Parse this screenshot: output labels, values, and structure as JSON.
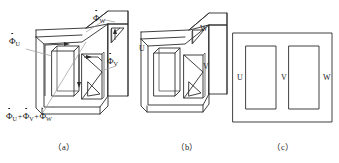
{
  "figure": {
    "type": "three-phase-transformer-core-diagram",
    "background_color": "#ffffff",
    "line_color": "#2b2b2b",
    "leader_color": "#9a9a9a"
  },
  "panels": [
    {
      "id": "a",
      "caption": "（a）",
      "description": "Three-dimensional three-phase transformer core with magnetic flux phasors",
      "flux_labels": [
        {
          "symbol": "Φ",
          "dot": true,
          "subscript": "U",
          "text": "Φ̇U"
        },
        {
          "symbol": "Φ",
          "dot": true,
          "subscript": "V",
          "text": "Φ̇V"
        },
        {
          "symbol": "Φ",
          "dot": true,
          "subscript": "W",
          "text": "Φ̇W"
        }
      ],
      "sum_label": {
        "parts": [
          {
            "symbol": "Φ",
            "dot": true,
            "subscript": "U"
          },
          {
            "op": "+"
          },
          {
            "symbol": "Φ",
            "dot": true,
            "subscript": "V"
          },
          {
            "op": "+"
          },
          {
            "symbol": "Φ",
            "dot": true,
            "subscript": "W"
          }
        ],
        "text": "Φ̇U+Φ̇V+Φ̇W"
      },
      "flux_arrows": 4
    },
    {
      "id": "b",
      "caption": "（b）",
      "description": "Same three-dimensional core with limb designations",
      "limb_labels": [
        "U",
        "V",
        "W"
      ]
    },
    {
      "id": "c",
      "caption": "（c）",
      "description": "Planar schematic of the three-limb core",
      "limb_labels": [
        "U",
        "V",
        "W"
      ],
      "window_count": 2
    }
  ]
}
